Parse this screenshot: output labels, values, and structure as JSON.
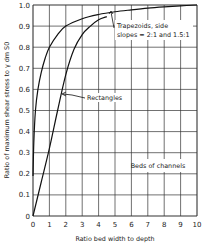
{
  "chart_data": {
    "type": "line",
    "title": "",
    "xlabel": "Ratio bed width to depth",
    "ylabel": "Ratio of maximum shear stress to γ dm S0",
    "xlim": [
      0,
      10
    ],
    "ylim": [
      0,
      1.0
    ],
    "x_ticks": [
      "0",
      "1",
      "2",
      "3",
      "4",
      "5",
      "6",
      "7",
      "8",
      "9",
      "10"
    ],
    "y_ticks": [
      "0",
      "0.1",
      "0.2",
      "0.3",
      "0.4",
      "0.5",
      "0.6",
      "0.7",
      "0.8",
      "0.9",
      "1.0"
    ],
    "grid": true,
    "legend_position": "annotations",
    "series": [
      {
        "name": "Trapezoids, side slopes = 2:1 and 1.5:1",
        "x": [
          0,
          0.05,
          0.15,
          0.3,
          0.5,
          0.75,
          1,
          1.5,
          2,
          3,
          4,
          5,
          6,
          7,
          8,
          9,
          10
        ],
        "y": [
          0.19,
          0.35,
          0.5,
          0.6,
          0.68,
          0.75,
          0.8,
          0.86,
          0.9,
          0.935,
          0.955,
          0.968,
          0.977,
          0.985,
          0.991,
          0.996,
          1.0
        ]
      },
      {
        "name": "Rectangles",
        "x": [
          0,
          0.5,
          1,
          1.5,
          2,
          2.5,
          3,
          3.5,
          4,
          4.5
        ],
        "y": [
          0,
          0.16,
          0.32,
          0.5,
          0.67,
          0.79,
          0.86,
          0.9,
          0.93,
          0.945
        ]
      }
    ],
    "annotations": [
      "Trapezoids, side slopes = 2:1 and 1.5:1",
      "Rectangles",
      "Beds of channels"
    ]
  },
  "labels": {
    "trap_line1": "Trapezoids, side",
    "trap_line2": "slopes = 2:1 and 1.5:1",
    "rect": "Rectangles",
    "beds": "Beds of channels",
    "xlabel": "Ratio bed width to depth",
    "ylabel": "Ratio of maximum shear stress to γ dm S0"
  }
}
